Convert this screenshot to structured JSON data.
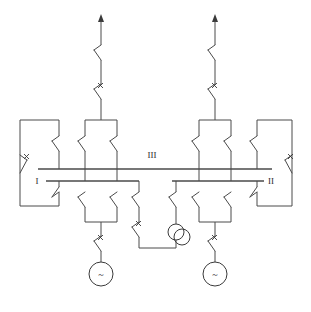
{
  "diagram": {
    "type": "electrical-single-line",
    "background_color": "#ffffff",
    "line_color": "#4a4a4a",
    "labels": {
      "bus_i": "I",
      "bus_ii": "II",
      "bus_iii": "III"
    },
    "buses": [
      {
        "id": "bus-iii",
        "label": "III",
        "x1": 38,
        "x2": 272,
        "y": 169,
        "label_x": 152,
        "label_y": 157
      },
      {
        "id": "bus-i",
        "label": "I",
        "x1": 46,
        "x2": 139,
        "y": 181,
        "label_x": 37,
        "label_y": 184
      },
      {
        "id": "bus-ii",
        "label": "II",
        "x1": 172,
        "x2": 264,
        "y": 181,
        "label_x": 270,
        "label_y": 184
      }
    ],
    "generators": [
      {
        "id": "generator-left",
        "symbol": "~",
        "cx": 101,
        "cy": 274,
        "r": 12
      },
      {
        "id": "generator-right",
        "symbol": "~",
        "cx": 215,
        "cy": 274,
        "r": 12
      }
    ],
    "transformer": {
      "id": "transformer-tie",
      "symbol": "two-winding",
      "c1x": 176,
      "c1y": 228,
      "c2x": 182,
      "c2y": 234,
      "r": 8
    },
    "feeders": [
      {
        "id": "feeder-left",
        "arrow_x": 101,
        "arrow_top_y": 14
      },
      {
        "id": "feeder-right",
        "arrow_x": 215,
        "arrow_top_y": 14
      }
    ],
    "switch_count": 22,
    "breaker_mark": "x"
  }
}
